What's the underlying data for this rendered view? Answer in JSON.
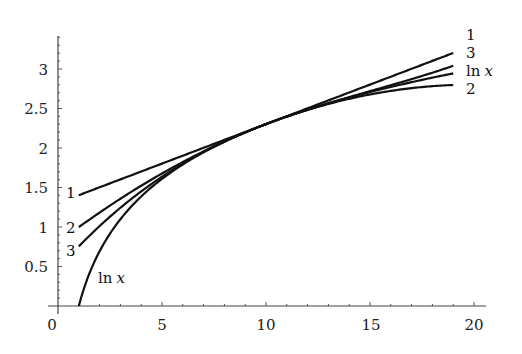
{
  "chart_data": {
    "type": "line",
    "title": "",
    "xlabel": "",
    "ylabel": "",
    "xlim": [
      0,
      20.5
    ],
    "ylim": [
      0,
      3.4
    ],
    "grid": false,
    "legend": "inline labels at curve ends",
    "x_ticks": [
      0,
      5,
      10,
      15,
      20
    ],
    "x_tick_labels": [
      "0",
      "5",
      "10",
      "15",
      "20"
    ],
    "y_ticks": [
      0.5,
      1,
      1.5,
      2,
      2.5,
      3
    ],
    "y_tick_labels": [
      "0.5",
      "1",
      "1.5",
      "2",
      "2.5",
      "3"
    ],
    "x": [
      1,
      2,
      3,
      4,
      5,
      6,
      7,
      8,
      9,
      10,
      11,
      12,
      13,
      14,
      15,
      16,
      17,
      18,
      19
    ],
    "series": [
      {
        "name": "1",
        "left_label": "1",
        "right_label": "1",
        "values": [
          1.403,
          1.503,
          1.603,
          1.703,
          1.803,
          1.903,
          2.003,
          2.103,
          2.203,
          2.303,
          2.403,
          2.503,
          2.603,
          2.703,
          2.803,
          2.903,
          3.003,
          3.103,
          3.203
        ]
      },
      {
        "name": "2",
        "left_label": "2",
        "right_label": "2",
        "values": [
          0.998,
          1.183,
          1.358,
          1.523,
          1.678,
          1.823,
          1.958,
          2.083,
          2.198,
          2.303,
          2.398,
          2.483,
          2.558,
          2.623,
          2.678,
          2.723,
          2.758,
          2.783,
          2.798
        ]
      },
      {
        "name": "3",
        "left_label": "3",
        "right_label": "3",
        "values": [
          0.755,
          1.012,
          1.244,
          1.451,
          1.636,
          1.802,
          1.949,
          2.08,
          2.198,
          2.303,
          2.398,
          2.486,
          2.567,
          2.644,
          2.72,
          2.795,
          2.873,
          2.954,
          3.041
        ]
      },
      {
        "name": "ln x",
        "left_label": "ln x",
        "right_label": "ln x",
        "values": [
          0.0,
          0.693,
          1.099,
          1.386,
          1.609,
          1.792,
          1.946,
          2.079,
          2.197,
          2.303,
          2.398,
          2.485,
          2.565,
          2.639,
          2.708,
          2.773,
          2.833,
          2.89,
          2.944
        ]
      }
    ]
  },
  "labels": {
    "right": {
      "s1": "1",
      "s3": "3",
      "ln": "ln",
      "x": "x",
      "s2": "2"
    },
    "left": {
      "s1": "1",
      "s2": "2",
      "s3": "3",
      "ln": "ln",
      "x": "x"
    },
    "xticks": [
      "0",
      "5",
      "10",
      "15",
      "20"
    ],
    "yticks": [
      "0.5",
      "1",
      "1.5",
      "2",
      "2.5",
      "3"
    ]
  }
}
